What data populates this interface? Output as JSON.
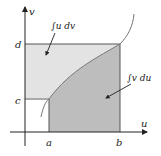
{
  "diagram": {
    "axes": {
      "x_label": "u",
      "y_label": "v"
    },
    "ticks": {
      "x": [
        "a",
        "b"
      ],
      "y": [
        "c",
        "d"
      ]
    },
    "regions": [
      {
        "id": "upper",
        "label": "∫u dv",
        "fill": "#e3e3e3"
      },
      {
        "id": "lower",
        "label": "∫v du",
        "fill": "#bdbdbd"
      }
    ],
    "colors": {
      "axis": "#222222",
      "curve": "#777777",
      "border": "#555555"
    }
  }
}
